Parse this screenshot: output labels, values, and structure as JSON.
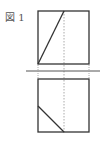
{
  "figure": {
    "label": "図 1",
    "stroke_color": "#333333",
    "dotted_color": "#aaaaaa",
    "top_view": {
      "square": {
        "x": 38,
        "y": 11,
        "w": 51,
        "h": 53
      },
      "diagonal": {
        "x1": 38,
        "y1": 64,
        "x2": 64,
        "y2": 11
      }
    },
    "ground_line": {
      "x1": 26,
      "y1": 71,
      "x2": 100,
      "y2": 71
    },
    "tick_marks_x": [
      38,
      64,
      89
    ],
    "dotted_vertical": {
      "x": 64,
      "y1": 11,
      "y2": 133
    },
    "bottom_view": {
      "square": {
        "x": 38,
        "y": 79,
        "w": 51,
        "h": 53
      },
      "diagonal": {
        "x1": 38,
        "y1": 106,
        "x2": 64,
        "y2": 132
      }
    }
  }
}
